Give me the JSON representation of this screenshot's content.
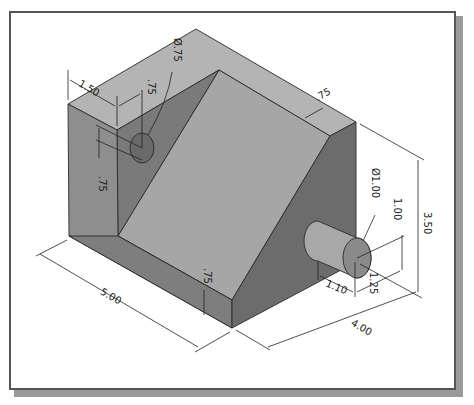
{
  "figure": {
    "type": "isometric engineering drawing",
    "units": "inches"
  },
  "dimensions": {
    "hole_diameter": "Ø.75",
    "hole_offset_from_left": "1.50",
    "hole_offset_from_wall": ".75",
    "hole_offset_vertical": ".75",
    "top_thickness": ".75",
    "base_thickness": ".75",
    "length": "5.00",
    "width": "4.00",
    "height": "3.50",
    "boss_diameter": "Ø1.00",
    "boss_height_location": "1.00",
    "boss_side_location": "1.25",
    "boss_length": "1.10"
  },
  "colors": {
    "top_face": "#b4b4b4",
    "ramp_face": "#a6a6a6",
    "left_face": "#8e8e8e",
    "front_face": "#7c7c7c",
    "inner_face": "#6e6e6e",
    "right_face": "#6a6a6a",
    "boss_side": "#a8a8a8",
    "boss_end": "#8a8a8a"
  }
}
